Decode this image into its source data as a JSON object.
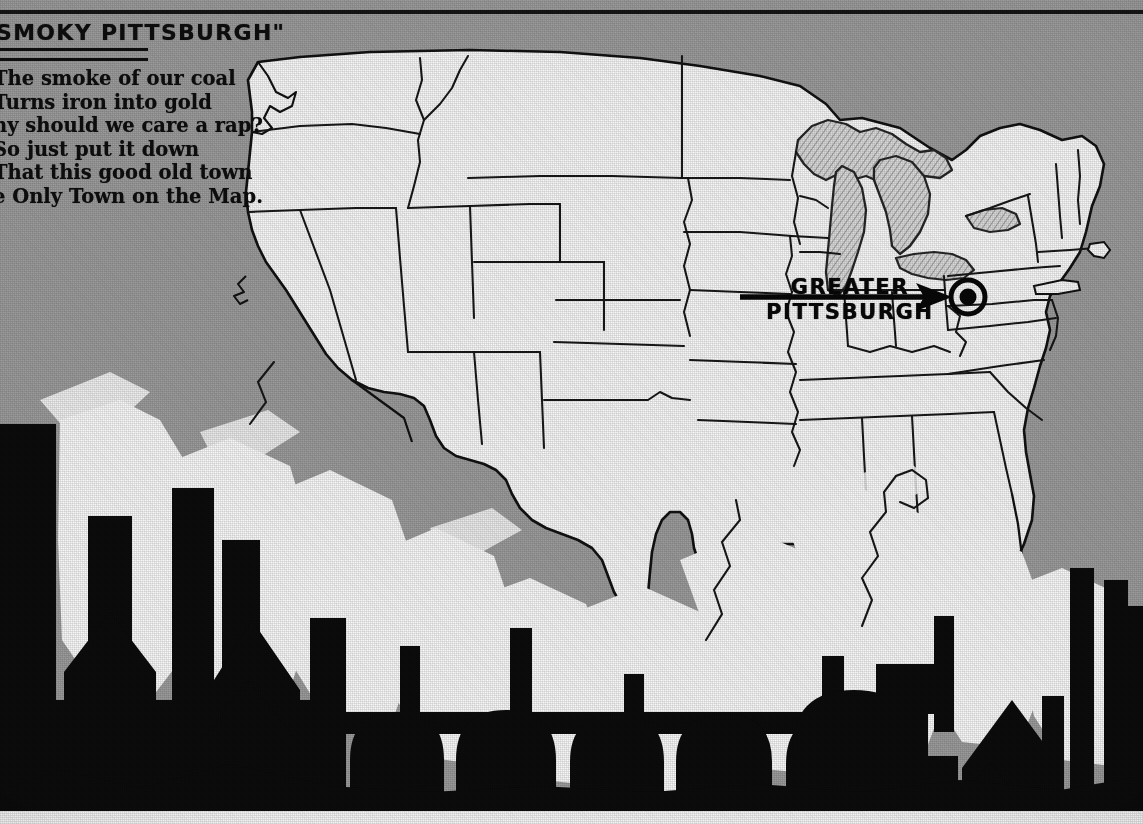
{
  "poster": {
    "width": 1143,
    "height": 824,
    "background_color": "#9b9b9b",
    "land_color": "#f4f2ec",
    "ink_color": "#141414",
    "silhouette_color": "#101010",
    "smoke_color": "#f5f3ee"
  },
  "masthead": {
    "title": "SMOKY PITTSBURGH\"",
    "verse": [
      "The smoke of our coal",
      "Turns iron into gold",
      "hy should we care a rap?",
      "So just put it down",
      "That this good old town",
      "e Only Town on the Map."
    ]
  },
  "map": {
    "subject": "United States",
    "callout": {
      "line1": "GREATER",
      "line2": "PITTSBURGH",
      "marker": "bullseye-target",
      "arrow_direction": "right",
      "arrow_start_x": 740,
      "arrow_end_x": 950,
      "arrow_y": 297,
      "marker_x": 968,
      "marker_y": 297
    },
    "features": [
      "state-boundaries",
      "great-lakes",
      "gulf-of-mexico",
      "atlantic-ocean",
      "pacific-ocean"
    ]
  },
  "industry": {
    "description": "Black silhouette of mills, blast furnaces, chimneys and factory roofs along the lower edge with white smoke plumes rising across the map",
    "elements": [
      "smokestack",
      "blast-furnace-row",
      "factory-roof",
      "gas-holder-dome",
      "mill-building",
      "smoke-plume"
    ]
  }
}
